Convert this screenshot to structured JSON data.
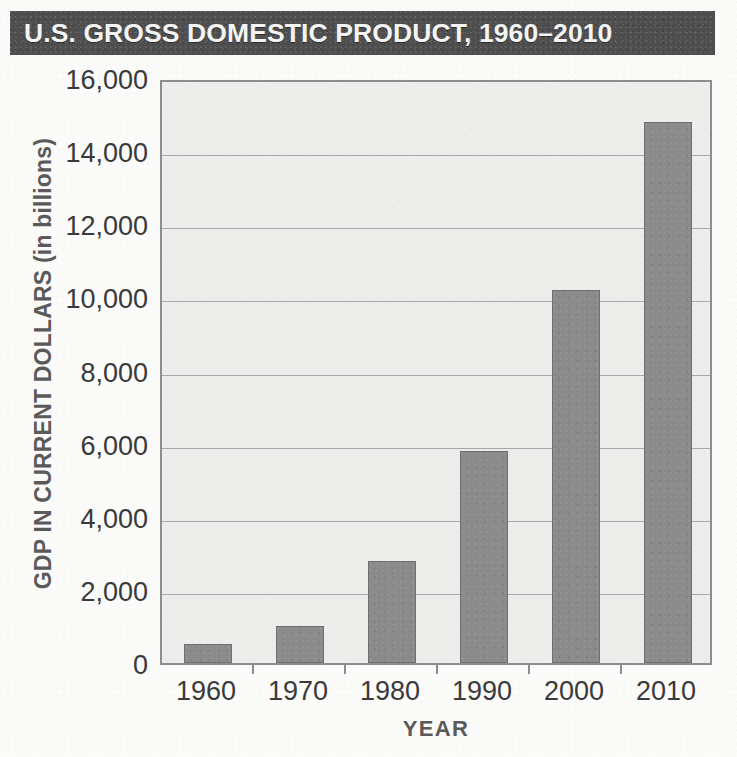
{
  "title": "U.S. GROSS DOMESTIC PRODUCT, 1960–2010",
  "colors": {
    "title_banner_bg": "#4e4e4e",
    "title_text": "#f4f4f4",
    "plot_bg": "#ededec",
    "plot_border": "#8d8d8d",
    "bar_fill": "#8b8b8b",
    "bar_border": "#6f6f6f",
    "gridline": "#a8a8a8",
    "axis_text": "#3a3a3a",
    "axis_title_text": "#5a5a5a"
  },
  "chart_data": {
    "type": "bar",
    "title": "U.S. GROSS DOMESTIC PRODUCT, 1960–2010",
    "xlabel": "YEAR",
    "ylabel": "GDP IN CURRENT DOLLARS (in billions)",
    "ylabel_main": "GDP IN CURRENT DOLLARS",
    "ylabel_units": "(in billions)",
    "categories": [
      "1960",
      "1970",
      "1980",
      "1990",
      "2000",
      "2010"
    ],
    "values": [
      520,
      1000,
      2800,
      5800,
      10200,
      14800
    ],
    "ylim": [
      0,
      16000
    ],
    "ytick_values": [
      0,
      2000,
      4000,
      6000,
      8000,
      10000,
      12000,
      14000,
      16000
    ],
    "ytick_labels": [
      "0",
      "2,000",
      "4,000",
      "6,000",
      "8,000",
      "10,000",
      "12,000",
      "14,000",
      "16,000"
    ],
    "grid": true,
    "legend": false,
    "legend_position": "none"
  }
}
